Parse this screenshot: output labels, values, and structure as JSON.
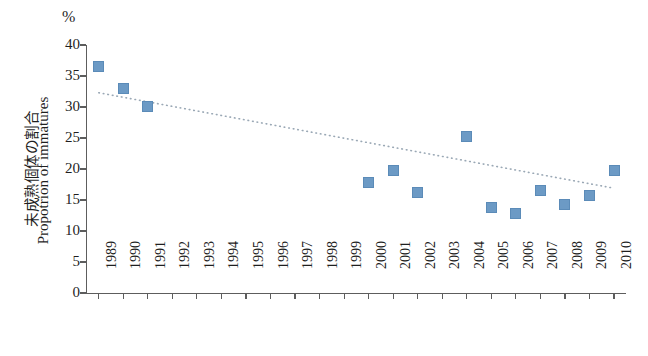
{
  "chart_data": {
    "type": "scatter",
    "title": "",
    "subtitle": "",
    "unit_label": "%",
    "ylabel": "Propotrion of immatures",
    "ylabel_jp": "未成熟個体の割合",
    "xlabel": "",
    "ylim": [
      0,
      40
    ],
    "ytick_values": [
      0,
      5,
      10,
      15,
      20,
      25,
      30,
      35,
      40
    ],
    "grid": false,
    "legend": "none",
    "marker_color": "#6c9ac5",
    "trendline_color": "#9aa8b5",
    "axis_color": "#5d5d5d",
    "categories": [
      "1989",
      "1990",
      "1991",
      "1992",
      "1993",
      "1994",
      "1995",
      "1996",
      "1997",
      "1998",
      "1999",
      "2000",
      "2001",
      "2002",
      "2003",
      "2004",
      "2005",
      "2006",
      "2007",
      "2008",
      "2009",
      "2010"
    ],
    "values": [
      36.5,
      33.0,
      30.1,
      null,
      null,
      null,
      null,
      null,
      null,
      null,
      null,
      17.8,
      19.7,
      16.2,
      null,
      25.2,
      13.8,
      12.9,
      16.5,
      14.2,
      15.8,
      19.7
    ],
    "points": [
      {
        "x": "1989",
        "y": 36.5
      },
      {
        "x": "1990",
        "y": 33.0
      },
      {
        "x": "1991",
        "y": 30.1
      },
      {
        "x": "2000",
        "y": 17.8
      },
      {
        "x": "2001",
        "y": 19.7
      },
      {
        "x": "2002",
        "y": 16.2
      },
      {
        "x": "2004",
        "y": 25.2
      },
      {
        "x": "2005",
        "y": 13.8
      },
      {
        "x": "2006",
        "y": 12.9
      },
      {
        "x": "2007",
        "y": 16.5
      },
      {
        "x": "2008",
        "y": 14.2
      },
      {
        "x": "2009",
        "y": 15.8
      },
      {
        "x": "2010",
        "y": 19.7
      }
    ],
    "trendline": {
      "style": "dotted",
      "start": {
        "x": "1989",
        "y": 32.3
      },
      "end": {
        "x": "2010",
        "y": 16.9
      }
    }
  }
}
